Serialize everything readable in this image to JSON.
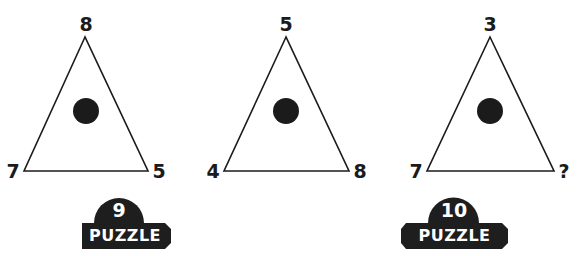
{
  "colors": {
    "background": "#ffffff",
    "ink": "#1b1b1b",
    "badge_fill": "#1e1e1e",
    "badge_text": "#ffffff"
  },
  "triangles": [
    {
      "top": "8",
      "bottom_left": "7",
      "bottom_right": "5",
      "center_mark": "filled-circle"
    },
    {
      "top": "5",
      "bottom_left": "4",
      "bottom_right": "8",
      "center_mark": "filled-circle"
    },
    {
      "top": "3",
      "bottom_left": "7",
      "bottom_right": "?",
      "center_mark": "filled-circle"
    }
  ],
  "badges": [
    {
      "number": "9",
      "word": "PUZZLE"
    },
    {
      "number": "10",
      "word": "PUZZLE"
    }
  ]
}
